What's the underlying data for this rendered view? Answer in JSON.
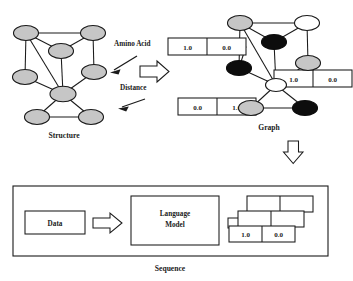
{
  "figure": {
    "colors": {
      "node_gray": "#c6c6c6",
      "node_black": "#0d0d0d",
      "node_white": "#ffffff",
      "line": "#1a1a1a",
      "background": "#ffffff"
    }
  },
  "structure_panel": {
    "caption": "Structure",
    "annotations": {
      "amino_acid": "Amino Acid",
      "distance": "Distance"
    },
    "nodes": [
      {
        "id": "s1",
        "cx": 26,
        "cy": 33,
        "rx": 12.5,
        "ry": 7.5,
        "color": "gray"
      },
      {
        "id": "s2",
        "cx": 93,
        "cy": 33,
        "rx": 12.5,
        "ry": 7.5,
        "color": "gray"
      },
      {
        "id": "s3",
        "cx": 61,
        "cy": 51,
        "rx": 12.5,
        "ry": 7.5,
        "color": "gray"
      },
      {
        "id": "s4",
        "cx": 25,
        "cy": 77,
        "rx": 12.5,
        "ry": 7.5,
        "color": "gray"
      },
      {
        "id": "s5",
        "cx": 94,
        "cy": 72,
        "rx": 12.5,
        "ry": 7.5,
        "color": "gray"
      },
      {
        "id": "s6",
        "cx": 63,
        "cy": 94,
        "rx": 13.0,
        "ry": 7.8,
        "color": "gray"
      },
      {
        "id": "s7",
        "cx": 37,
        "cy": 117,
        "rx": 12.5,
        "ry": 7.5,
        "color": "gray"
      },
      {
        "id": "s8",
        "cx": 91,
        "cy": 117,
        "rx": 12.5,
        "ry": 7.5,
        "color": "gray"
      }
    ],
    "edges": [
      [
        "s1",
        "s2"
      ],
      [
        "s1",
        "s3"
      ],
      [
        "s1",
        "s4"
      ],
      [
        "s1",
        "s6"
      ],
      [
        "s2",
        "s3"
      ],
      [
        "s2",
        "s5"
      ],
      [
        "s3",
        "s6"
      ],
      [
        "s4",
        "s6"
      ],
      [
        "s5",
        "s6"
      ],
      [
        "s6",
        "s7"
      ],
      [
        "s6",
        "s8"
      ],
      [
        "s7",
        "s8"
      ]
    ]
  },
  "graph_panel": {
    "caption": "Graph",
    "nodes": [
      {
        "id": "g1",
        "cx": 240,
        "cy": 23,
        "rx": 12.5,
        "ry": 7.5,
        "color": "gray"
      },
      {
        "id": "g2",
        "cx": 307,
        "cy": 23,
        "rx": 12.5,
        "ry": 7.5,
        "color": "white"
      },
      {
        "id": "g3",
        "cx": 274,
        "cy": 42,
        "rx": 12.5,
        "ry": 7.5,
        "color": "black"
      },
      {
        "id": "g4",
        "cx": 239,
        "cy": 68,
        "rx": 12.5,
        "ry": 7.5,
        "color": "black"
      },
      {
        "id": "g5",
        "cx": 308,
        "cy": 63,
        "rx": 12.5,
        "ry": 7.5,
        "color": "gray"
      },
      {
        "id": "g6",
        "cx": 276,
        "cy": 85,
        "rx": 12.5,
        "ry": 7.5,
        "color": "white"
      },
      {
        "id": "g7",
        "cx": 251,
        "cy": 108,
        "rx": 12.5,
        "ry": 7.5,
        "color": "gray"
      },
      {
        "id": "g8",
        "cx": 305,
        "cy": 108,
        "rx": 12.5,
        "ry": 7.5,
        "color": "black"
      }
    ],
    "edges": [
      [
        "g1",
        "g2"
      ],
      [
        "g1",
        "g3"
      ],
      [
        "g1",
        "g4"
      ],
      [
        "g1",
        "g6"
      ],
      [
        "g2",
        "g3"
      ],
      [
        "g2",
        "g5"
      ],
      [
        "g3",
        "g6"
      ],
      [
        "g4",
        "g6"
      ],
      [
        "g5",
        "g6"
      ],
      [
        "g6",
        "g7"
      ],
      [
        "g6",
        "g8"
      ],
      [
        "g7",
        "g8"
      ]
    ],
    "feature_boxes": [
      {
        "id": "box-top-left",
        "x": 168,
        "y": 38,
        "w": 78,
        "h": 17,
        "cells": [
          "1.0",
          "0.0"
        ],
        "attached_to": "g4"
      },
      {
        "id": "box-right",
        "x": 274,
        "y": 70,
        "w": 78,
        "h": 17,
        "cells": [
          "1.0",
          "0.0"
        ],
        "attached_to": "g5"
      },
      {
        "id": "box-bottom-left",
        "x": 178,
        "y": 98,
        "w": 78,
        "h": 17,
        "cells": [
          "0.0",
          "1.0"
        ],
        "attached_to": "g7"
      }
    ]
  },
  "sequence_panel": {
    "caption": "Sequence",
    "data_box": {
      "label": "Data"
    },
    "model_box": {
      "label": "Language\nModel",
      "line1": "Language",
      "line2": "Model"
    },
    "output_stack": {
      "rows": [
        {
          "id": "row-back",
          "cells": [
            "",
            ""
          ]
        },
        {
          "id": "row-middle",
          "cells": [
            "",
            ""
          ]
        },
        {
          "id": "row-front",
          "cells": [
            "1.0",
            "0.0"
          ]
        }
      ]
    }
  },
  "flow_arrows": [
    {
      "id": "arrow-structure-to-graph",
      "direction": "right"
    },
    {
      "id": "arrow-sequence-to-graph",
      "direction": "up"
    },
    {
      "id": "arrow-data-to-model",
      "direction": "right"
    },
    {
      "id": "arrow-model-to-output",
      "direction": "right"
    }
  ]
}
